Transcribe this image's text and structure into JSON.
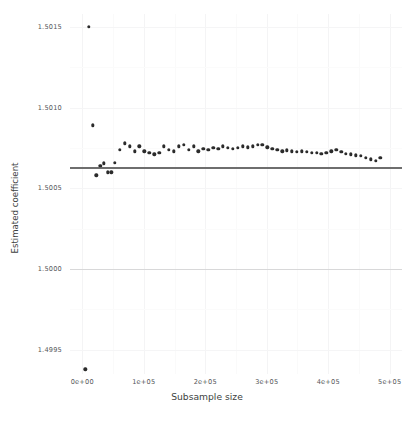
{
  "chart_data": {
    "type": "scatter",
    "title": "",
    "xlabel": "Subsample size",
    "ylabel": "Estimated coefficient",
    "xlim": [
      -20000,
      520000
    ],
    "ylim": [
      1.49935,
      1.50158
    ],
    "xticks": [
      "0e+00",
      "1e+05",
      "2e+05",
      "3e+05",
      "4e+05",
      "5e+05"
    ],
    "xtick_values": [
      0,
      100000,
      200000,
      300000,
      400000,
      500000
    ],
    "yticks": [
      "1.5015",
      "1.5010",
      "1.5005",
      "1.5000",
      "1.4995"
    ],
    "ytick_values": [
      1.5015,
      1.501,
      1.5005,
      1.5,
      1.4995
    ],
    "grid": true,
    "legend": null,
    "reference_lines": [
      {
        "name": "fitted-reference-line",
        "y": 1.500632,
        "color": "#6e6e6e"
      },
      {
        "name": "true-value-gridline",
        "y": 1.5,
        "color": "#d8d8d9"
      }
    ],
    "series": [
      {
        "name": "Estimated coefficient",
        "color": "#2b2b2b",
        "x": [
          5000,
          11000,
          17000,
          23000,
          29000,
          35000,
          41000,
          47000,
          53000,
          61000,
          69000,
          77000,
          85000,
          93000,
          101000,
          109000,
          117000,
          125000,
          133000,
          141000,
          149000,
          157000,
          165000,
          173000,
          181000,
          189000,
          197000,
          205000,
          213000,
          221000,
          229000,
          237000,
          245000,
          253000,
          261000,
          269000,
          277000,
          285000,
          293000,
          301000,
          309000,
          317000,
          325000,
          333000,
          341000,
          349000,
          357000,
          365000,
          373000,
          381000,
          389000,
          397000,
          405000,
          413000,
          421000,
          429000,
          437000,
          445000,
          453000,
          461000,
          469000,
          477000,
          485000
        ],
        "y": [
          1.49938,
          1.5015,
          1.50089,
          1.50058,
          1.50064,
          1.500655,
          1.5006,
          1.5006,
          1.50066,
          1.50074,
          1.50078,
          1.50076,
          1.50073,
          1.50076,
          1.50073,
          1.50072,
          1.50071,
          1.50072,
          1.50076,
          1.50074,
          1.50073,
          1.50076,
          1.50077,
          1.50074,
          1.50076,
          1.50073,
          1.500745,
          1.50074,
          1.50075,
          1.500745,
          1.50076,
          1.50075,
          1.500745,
          1.50075,
          1.50076,
          1.500755,
          1.50076,
          1.50077,
          1.50077,
          1.500755,
          1.500745,
          1.50074,
          1.50073,
          1.500735,
          1.50073,
          1.500725,
          1.50073,
          1.500725,
          1.50072,
          1.50072,
          1.500715,
          1.50072,
          1.50073,
          1.50074,
          1.500725,
          1.500715,
          1.50071,
          1.500705,
          1.5007,
          1.50069,
          1.50068,
          1.50067,
          1.50069
        ]
      }
    ]
  }
}
